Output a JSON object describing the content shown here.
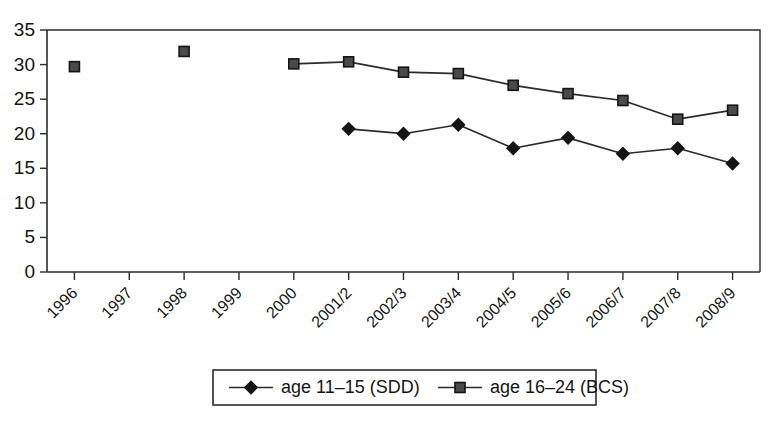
{
  "chart_data": {
    "type": "line",
    "title": "",
    "subtitle": "",
    "xlabel": "",
    "ylabel": "",
    "categories": [
      "1996",
      "1997",
      "1998",
      "1999",
      "2000",
      "2001/2",
      "2002/3",
      "2003/4",
      "2004/5",
      "2005/6",
      "2006/7",
      "2007/8",
      "2008/9"
    ],
    "ylim": [
      0,
      35
    ],
    "yticks": [
      0,
      5,
      10,
      15,
      20,
      25,
      30,
      35
    ],
    "grid": false,
    "legend_position": "bottom-center",
    "series": [
      {
        "name": "age 11–15 (SDD)",
        "marker": "diamond",
        "color": "#151515",
        "values": [
          null,
          null,
          null,
          null,
          null,
          20.7,
          20.0,
          21.3,
          17.9,
          19.4,
          17.1,
          17.9,
          15.7
        ]
      },
      {
        "name": "age 16–24 (BCS)",
        "marker": "square",
        "color": "#4a4a4a",
        "values": [
          29.7,
          null,
          31.9,
          null,
          30.1,
          30.4,
          28.9,
          28.7,
          27.0,
          25.8,
          24.8,
          22.1,
          23.4
        ]
      }
    ]
  },
  "legend": {
    "items": [
      {
        "label": "age 11–15 (SDD)",
        "marker": "diamond"
      },
      {
        "label": "age 16–24 (BCS)",
        "marker": "square"
      }
    ]
  },
  "colors": {
    "axis": "#2b2b2b",
    "text": "#151515",
    "background": "#ffffff",
    "series_sdd": "#151515",
    "series_bcs": "#4a4a4a"
  }
}
